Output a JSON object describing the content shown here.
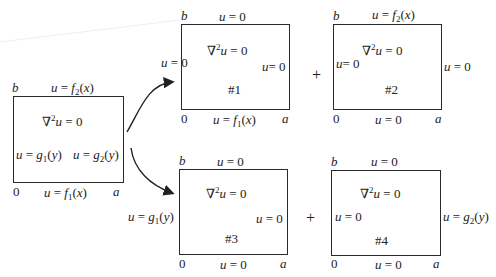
{
  "diagram": {
    "original": {
      "equation": "∇²u = 0",
      "top_bc": "u = f₂(x)",
      "bottom_bc": "u = f₁(x)",
      "left_bc": "u = g₁(y)",
      "right_bc": "u = g₂(y)",
      "corner_b": "b",
      "corner_0": "0",
      "corner_a": "a"
    },
    "subproblems": [
      {
        "id": "#1",
        "equation": "∇²u = 0",
        "top_bc": "u = 0",
        "bottom_bc": "u = f₁(x)",
        "left_bc": "u = 0",
        "right_bc": "u= 0",
        "corner_b": "b",
        "corner_0": "0",
        "corner_a": "a"
      },
      {
        "id": "#2",
        "equation": "∇²u = 0",
        "top_bc": "u = f₂(x)",
        "bottom_bc": "u = 0",
        "left_bc": "u= 0",
        "right_bc": "u = 0",
        "corner_b": "b",
        "corner_0": "0",
        "corner_a": "a"
      },
      {
        "id": "#3",
        "equation": "∇²u = 0",
        "top_bc": "u = 0",
        "bottom_bc": "u = 0",
        "left_bc": "u = g₁(y)",
        "right_bc": "u = 0",
        "corner_b": "b",
        "corner_0": "0",
        "corner_a": "a"
      },
      {
        "id": "#4",
        "equation": "∇²u = 0",
        "top_bc": "u = 0",
        "bottom_bc": "u = 0",
        "left_bc": "u = 0",
        "right_bc": "u = g₂(y)",
        "corner_b": "b",
        "corner_0": "0",
        "corner_a": "a"
      }
    ],
    "operators": [
      "+",
      "+"
    ]
  }
}
